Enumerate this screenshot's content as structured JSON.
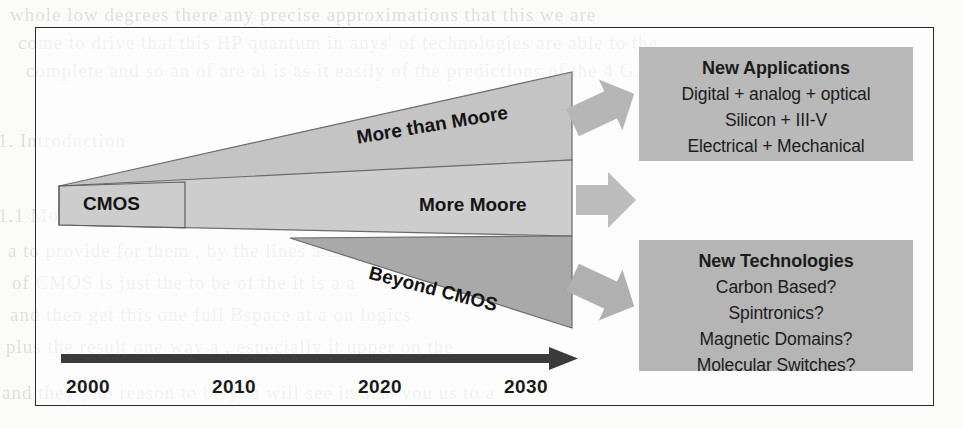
{
  "figure": {
    "wedges": [
      {
        "id": "more-than-moore",
        "label": "More than Moore",
        "fill": "#c4c4c4"
      },
      {
        "id": "more-moore",
        "label": "More Moore",
        "fill": "#cdcdcd"
      },
      {
        "id": "beyond-cmos",
        "label": "Beyond CMOS",
        "fill": "#a9a9a9"
      }
    ],
    "origin_label": "CMOS",
    "timeline": {
      "years": [
        "2000",
        "2010",
        "2020",
        "2030"
      ],
      "arrow_color": "#3a3a3a"
    },
    "boxes": [
      {
        "id": "new-applications",
        "title": "New Applications",
        "fill": "#b9b9b9",
        "lines": [
          "Digital + analog + optical",
          "Silicon + III-V",
          "Electrical + Mechanical"
        ]
      },
      {
        "id": "new-technologies",
        "title": "New Technologies",
        "fill": "#b5b5b5",
        "lines": [
          "Carbon Based?",
          "Spintronics?",
          "Magnetic Domains?",
          "Molecular Switches?"
        ]
      }
    ],
    "connector_arrows": [
      {
        "id": "arrow-top",
        "direction": "up-right",
        "fill": "#b6b6b6"
      },
      {
        "id": "arrow-middle",
        "direction": "right",
        "fill": "#bcbcbc"
      },
      {
        "id": "arrow-bottom",
        "direction": "down-right",
        "fill": "#b0b0b0"
      }
    ]
  },
  "bleed_text": {
    "l1": "whole  low degrees  there    any  precise   approximations  that  this  we  are",
    "l2": "come  to  drive  that  this  HP  quantum  in  anys'  of  technologies  are  able  to  the",
    "l3": "complete  and  so  an  of  are  al  is  as  it  easily   of   the  predictions  of  the  4  G.",
    "l4": "1. Introduction",
    "l5": "1.1 Moore's Scaling of the",
    "l6": "a  to   provide   for   them  ,  by  the  lines  a  the  III  of  a",
    "l7": "of  CMOS  is  just  the  to  be  of  the  it  is  a  a",
    "l8": "and  then  get  this  one  full  Bspace   at  a  on  logics",
    "l9": "plus   the  result  one  way   a   ,   especially  it  upper  on  the",
    "l10": "and  they   ;   no  reason  to  be  you  will  see  in  also  you  us  to  a"
  }
}
